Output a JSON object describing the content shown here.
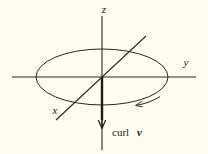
{
  "figure": {
    "caption": "curl v vector diagram",
    "background_color": "#fdfcef",
    "ink_color": "#2a2822",
    "axes": [
      {
        "id": "z",
        "label": "z",
        "orientation": "vertical",
        "label_x": 104,
        "label_y": 13
      },
      {
        "id": "y",
        "label": "y",
        "orientation": "horizontal-right",
        "label_x": 186,
        "label_y": 66
      },
      {
        "id": "x",
        "label": "x",
        "orientation": "oblique-lower-left",
        "label_x": 55,
        "label_y": 114
      }
    ],
    "vector": {
      "label_text": "curl",
      "label_symbol": "v",
      "direction": "down",
      "label_x": 118,
      "label_y": 135
    },
    "circulation": {
      "shape": "ellipse",
      "arrow_direction": "leftward-on-near-side",
      "center_x": 102,
      "center_y": 77,
      "rx": 66,
      "ry": 28
    }
  }
}
